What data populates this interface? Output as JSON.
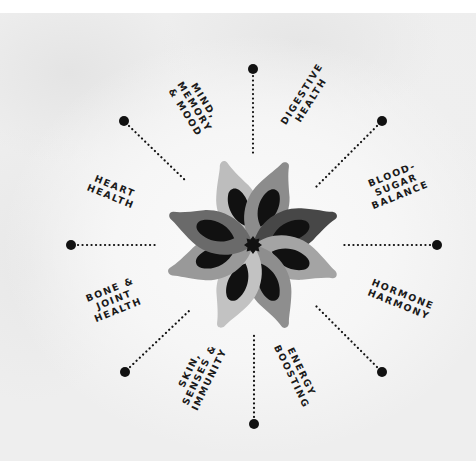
{
  "diagram": {
    "type": "radial-flower",
    "center": {
      "x": 253,
      "y": 245
    },
    "colors": {
      "text": "#1a1a1a",
      "dot": "#111111",
      "petal_light": "#bdbdbd",
      "petal_mid": "#9a9a9a",
      "petal_dark": "#5a5a5a",
      "petal_darker": "#464646",
      "petal_inner": "#111111",
      "center": "#111111"
    },
    "categories": [
      {
        "id": "digestive",
        "label": "DIGESTIVE\nHEALTH",
        "direction": "N"
      },
      {
        "id": "blood-sugar",
        "label": "BLOOD-\nSUGAR\nBALANCE",
        "direction": "NE"
      },
      {
        "id": "hormone",
        "label": "HORMONE\nHARMONY",
        "direction": "E"
      },
      {
        "id": "energy",
        "label": "ENERGY\nBOOSTING",
        "direction": "SE"
      },
      {
        "id": "skin",
        "label": "SKIN,\nSENSES &\nIMMUNITY",
        "direction": "S"
      },
      {
        "id": "bone",
        "label": "BONE &\nJOINT\nHEALTH",
        "direction": "SW"
      },
      {
        "id": "heart",
        "label": "HEART\nHEALTH",
        "direction": "W"
      },
      {
        "id": "mind",
        "label": "MIND,\nMEMORY\n& MOOD",
        "direction": "NW"
      }
    ]
  }
}
